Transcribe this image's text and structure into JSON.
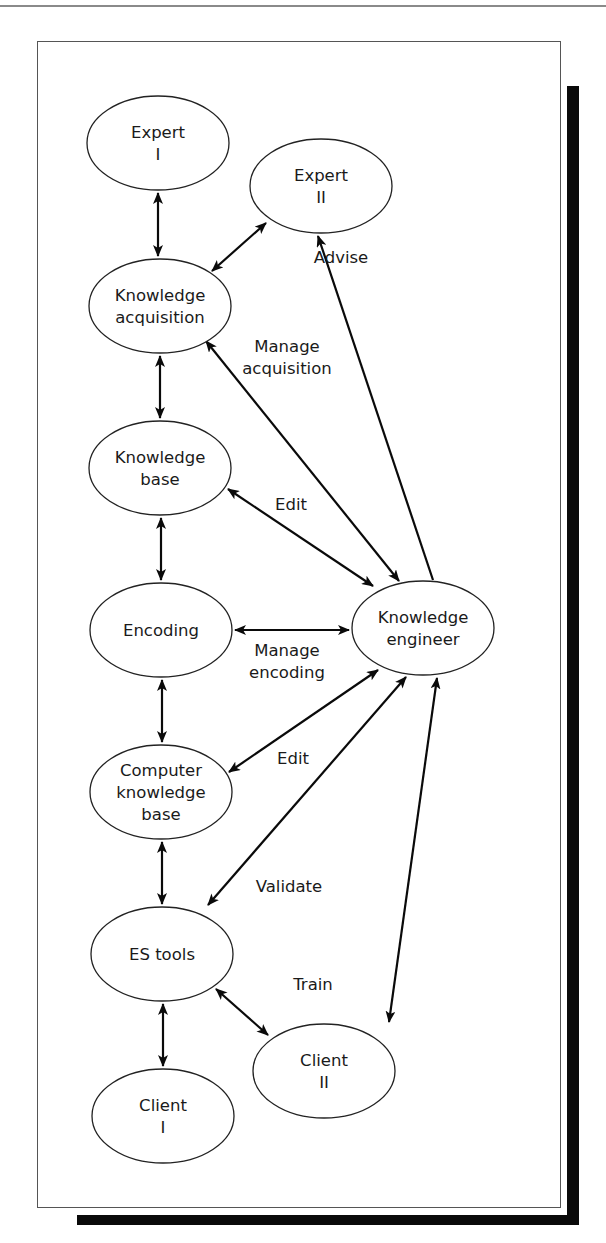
{
  "figure": {
    "type": "knowledge-engineering-process-diagram",
    "nodes": [
      {
        "id": "expert1",
        "lines": [
          "Expert",
          "I"
        ],
        "cx": 158,
        "cy": 143,
        "rx": 71,
        "ry": 47
      },
      {
        "id": "expert2",
        "lines": [
          "Expert",
          "II"
        ],
        "cx": 321,
        "cy": 186,
        "rx": 71,
        "ry": 47
      },
      {
        "id": "kacq",
        "lines": [
          "Knowledge",
          "acquisition"
        ],
        "cx": 160,
        "cy": 306,
        "rx": 71,
        "ry": 47
      },
      {
        "id": "kbase",
        "lines": [
          "Knowledge",
          "base"
        ],
        "cx": 160,
        "cy": 468,
        "rx": 71,
        "ry": 47
      },
      {
        "id": "encoding",
        "lines": [
          "Encoding"
        ],
        "cx": 161,
        "cy": 630,
        "rx": 71,
        "ry": 47
      },
      {
        "id": "kengineer",
        "lines": [
          "Knowledge",
          "engineer"
        ],
        "cx": 423,
        "cy": 628,
        "rx": 71,
        "ry": 47
      },
      {
        "id": "ckb",
        "lines": [
          "Computer",
          "knowledge",
          "base"
        ],
        "cx": 161,
        "cy": 792,
        "rx": 71,
        "ry": 47
      },
      {
        "id": "estools",
        "lines": [
          "ES tools"
        ],
        "cx": 162,
        "cy": 954,
        "rx": 71,
        "ry": 47
      },
      {
        "id": "client2",
        "lines": [
          "Client",
          "II"
        ],
        "cx": 324,
        "cy": 1071,
        "rx": 71,
        "ry": 47
      },
      {
        "id": "client1",
        "lines": [
          "Client",
          "I"
        ],
        "cx": 163,
        "cy": 1116,
        "rx": 71,
        "ry": 47
      }
    ],
    "edges": [
      {
        "from": "expert1",
        "to": "kacq",
        "label": "",
        "bidirectional": true,
        "x1": 158,
        "y1": 193,
        "x2": 158,
        "y2": 256
      },
      {
        "from": "kacq",
        "to": "expert2",
        "label": "",
        "bidirectional": true,
        "x1": 212,
        "y1": 271,
        "x2": 266,
        "y2": 223
      },
      {
        "from": "kengineer",
        "to": "expert2",
        "label": "Advise",
        "bidirectional": false,
        "x1": 433,
        "y1": 580,
        "x2": 318,
        "y2": 236
      },
      {
        "from": "kacq",
        "to": "kengineer",
        "label": "Manage acquisition",
        "bidirectional": true,
        "x1": 206,
        "y1": 341,
        "x2": 399,
        "y2": 581
      },
      {
        "from": "kacq",
        "to": "kbase",
        "label": "",
        "bidirectional": true,
        "x1": 160,
        "y1": 356,
        "x2": 160,
        "y2": 418
      },
      {
        "from": "kbase",
        "to": "kengineer",
        "label": "Edit",
        "bidirectional": true,
        "x1": 228,
        "y1": 489,
        "x2": 373,
        "y2": 586
      },
      {
        "from": "kbase",
        "to": "encoding",
        "label": "",
        "bidirectional": true,
        "x1": 161,
        "y1": 518,
        "x2": 161,
        "y2": 580
      },
      {
        "from": "encoding",
        "to": "kengineer",
        "label": "Manage encoding",
        "bidirectional": true,
        "x1": 235,
        "y1": 630,
        "x2": 349,
        "y2": 630
      },
      {
        "from": "encoding",
        "to": "ckb",
        "label": "",
        "bidirectional": true,
        "x1": 162,
        "y1": 680,
        "x2": 162,
        "y2": 742
      },
      {
        "from": "ckb",
        "to": "kengineer",
        "label": "Edit",
        "bidirectional": true,
        "x1": 229,
        "y1": 772,
        "x2": 378,
        "y2": 670
      },
      {
        "from": "kengineer",
        "to": "estools",
        "label": "Validate",
        "bidirectional": true,
        "x1": 406,
        "y1": 677,
        "x2": 208,
        "y2": 905
      },
      {
        "from": "ckb",
        "to": "estools",
        "label": "",
        "bidirectional": true,
        "x1": 162,
        "y1": 842,
        "x2": 162,
        "y2": 904
      },
      {
        "from": "kengineer",
        "to": "client2",
        "label": "Train",
        "bidirectional": true,
        "x1": 437,
        "y1": 678,
        "x2": 389,
        "y2": 1022
      },
      {
        "from": "estools",
        "to": "client2",
        "label": "",
        "bidirectional": true,
        "x1": 216,
        "y1": 989,
        "x2": 268,
        "y2": 1035
      },
      {
        "from": "estools",
        "to": "client1",
        "label": "",
        "bidirectional": true,
        "x1": 163,
        "y1": 1004,
        "x2": 163,
        "y2": 1066
      }
    ],
    "edge_labels": [
      {
        "id": "advise",
        "lines": [
          "Advise"
        ],
        "x": 341,
        "y": 263
      },
      {
        "id": "manage-acquisition",
        "lines": [
          "Manage",
          "acquisition"
        ],
        "x": 287,
        "y": 352
      },
      {
        "id": "edit-kb",
        "lines": [
          "Edit"
        ],
        "x": 291,
        "y": 510
      },
      {
        "id": "manage-encoding",
        "lines": [
          "Manage",
          "encoding"
        ],
        "x": 287,
        "y": 656
      },
      {
        "id": "edit-ckb",
        "lines": [
          "Edit"
        ],
        "x": 293,
        "y": 764
      },
      {
        "id": "validate",
        "lines": [
          "Validate"
        ],
        "x": 289,
        "y": 892
      },
      {
        "id": "train",
        "lines": [
          "Train"
        ],
        "x": 313,
        "y": 990
      }
    ]
  },
  "colors": {
    "line": "#0a0a0a",
    "frame": "#555555",
    "shadow": "#0a0a0a",
    "background": "#ffffff"
  }
}
